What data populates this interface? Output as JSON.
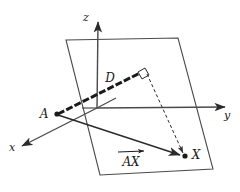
{
  "figure": {
    "type": "geometry-diagram",
    "background_color": "#ffffff",
    "stroke_color": "#2b2b2b",
    "labels": {
      "axis_x": "x",
      "axis_y": "y",
      "axis_z": "z",
      "point_a": "A",
      "point_x": "X",
      "segment_d": "D",
      "vector_ax": "AX"
    },
    "geometry": {
      "origin": {
        "x": 97,
        "y": 108
      },
      "axis_x_tip": {
        "x": 18,
        "y": 148
      },
      "axis_y_tip": {
        "x": 229,
        "y": 107
      },
      "axis_z_tip": {
        "x": 98,
        "y": 18
      },
      "point_a": {
        "x": 57,
        "y": 114
      },
      "point_x": {
        "x": 185,
        "y": 156
      },
      "foot_point": {
        "x": 146,
        "y": 70
      },
      "plane_corners": [
        {
          "x": 66,
          "y": 40
        },
        {
          "x": 178,
          "y": 38
        },
        {
          "x": 213,
          "y": 169
        },
        {
          "x": 100,
          "y": 175
        }
      ]
    },
    "elements": {
      "plane_name": "oblique-plane",
      "right_angle_marker": "right-angle-square",
      "dashed_projection": "dashed-projection-line",
      "normal_segment": "normal-segment-A-to-foot",
      "vector_arrow": "vector-A-to-X"
    }
  }
}
